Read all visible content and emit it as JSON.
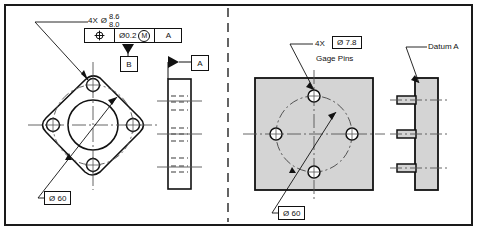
{
  "drawing": {
    "title": "GD&T position tolerance part and gage illustration",
    "border_color": "#1a1a1a",
    "line_color": "#111111",
    "shade_color": "#d4d4d4",
    "divider": "dashed-vertical-center"
  },
  "left_view": {
    "caption": "part drawing",
    "hole_callout": {
      "quantity": "4X",
      "diameter_symbol": "Ø",
      "limit_upper": "8.6",
      "limit_lower": "8.0"
    },
    "feature_control_frame": {
      "geometric_symbol": "position",
      "tolerance": "Ø0.2",
      "material_modifier": "M",
      "datum_primary": "A"
    },
    "datum_feature_b": "B",
    "datum_feature_a": "A",
    "bolt_circle": {
      "label": "Ø 60"
    },
    "front_view_shape": "rounded-diamond-flange",
    "side_view_shape": "rectangular-plate-with-hidden-holes"
  },
  "right_view": {
    "caption": "functional gage",
    "pin_callout": {
      "quantity": "4X",
      "diameter": "Ø 7.8",
      "description": "Gage Pins"
    },
    "datum_label": "Datum A",
    "bolt_circle": {
      "label": "Ø 60"
    },
    "front_view_shape": "shaded-square-gage-plate",
    "side_view_shape": "shaded-plate-with-three-pins"
  }
}
